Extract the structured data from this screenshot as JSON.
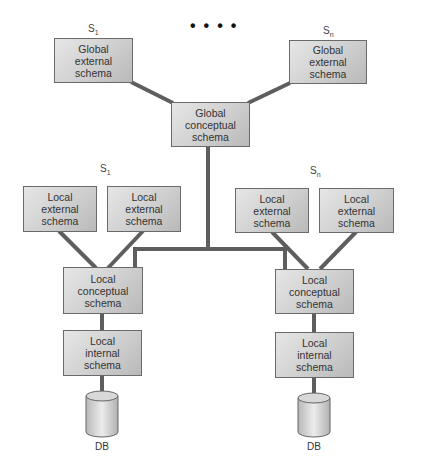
{
  "diagram": {
    "ellipsis": "••••",
    "global": {
      "external_left": {
        "site": "S",
        "site_sub": "1",
        "label": "Global\nexternal\nschema"
      },
      "external_right": {
        "site": "S",
        "site_sub": "n",
        "label": "Global\nexternal\nschema"
      },
      "conceptual": {
        "label": "Global\nconceptual\nschema"
      }
    },
    "sites": [
      {
        "site": "S",
        "site_sub": "1",
        "external": [
          {
            "label": "Local\nexternal\nschema"
          },
          {
            "label": "Local\nexternal\nschema"
          }
        ],
        "conceptual": {
          "label": "Local\nconceptual\nschema"
        },
        "internal": {
          "label": "Local\ninternal\nschema"
        },
        "db": {
          "label": "DB"
        }
      },
      {
        "site": "S",
        "site_sub": "n",
        "external": [
          {
            "label": "Local\nexternal\nschema"
          },
          {
            "label": "Local\nexternal\nschema"
          }
        ],
        "conceptual": {
          "label": "Local\nconceptual\nschema"
        },
        "internal": {
          "label": "Local\ninternal\nschema"
        },
        "db": {
          "label": "DB"
        }
      }
    ],
    "colors": {
      "connector": "#5e5e5e",
      "box_border": "#6a6a6a",
      "box_fill": "#cfcfcf"
    }
  }
}
